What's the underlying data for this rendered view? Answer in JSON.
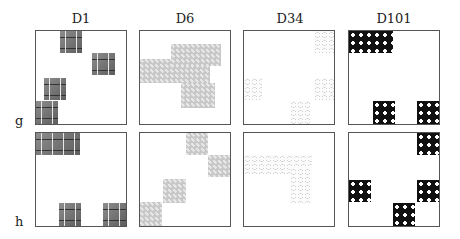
{
  "figure": {
    "column_titles": [
      "D1",
      "D6",
      "D34",
      "D101"
    ],
    "row_labels": [
      "g",
      "h"
    ]
  },
  "panels": {
    "g": {
      "D1": {
        "texture": "brick-stone",
        "patches": [
          [
            0.27,
            0.0,
            0.24,
            0.24
          ],
          [
            0.62,
            0.24,
            0.25,
            0.24
          ],
          [
            0.09,
            0.51,
            0.24,
            0.24
          ],
          [
            0.0,
            0.75,
            0.24,
            0.25
          ]
        ]
      },
      "D6": {
        "texture": "honeycomb-gray",
        "patches": [
          [
            0.0,
            0.3,
            0.78,
            0.26
          ],
          [
            0.35,
            0.14,
            0.55,
            0.24
          ],
          [
            0.46,
            0.56,
            0.38,
            0.27
          ]
        ]
      },
      "D34": {
        "texture": "mesh-pale",
        "patches": [
          [
            0.78,
            0.0,
            0.22,
            0.24
          ],
          [
            0.0,
            0.51,
            0.2,
            0.24
          ],
          [
            0.78,
            0.51,
            0.22,
            0.24
          ],
          [
            0.51,
            0.75,
            0.22,
            0.25
          ]
        ]
      },
      "D101": {
        "texture": "black-circles",
        "patches": [
          [
            0.0,
            0.0,
            0.49,
            0.24
          ],
          [
            0.27,
            0.75,
            0.24,
            0.25
          ],
          [
            0.76,
            0.75,
            0.24,
            0.25
          ]
        ]
      }
    },
    "h": {
      "D1": {
        "texture": "brick-stone",
        "patches": [
          [
            0.0,
            0.0,
            0.49,
            0.24
          ],
          [
            0.25,
            0.75,
            0.24,
            0.25
          ],
          [
            0.74,
            0.75,
            0.26,
            0.25
          ]
        ]
      },
      "D6": {
        "texture": "honeycomb-gray",
        "patches": [
          [
            0.51,
            0.0,
            0.24,
            0.24
          ],
          [
            0.75,
            0.24,
            0.25,
            0.24
          ],
          [
            0.25,
            0.49,
            0.25,
            0.26
          ],
          [
            0.0,
            0.74,
            0.24,
            0.26
          ]
        ]
      },
      "D34": {
        "texture": "mesh-pale",
        "patches": [
          [
            0.0,
            0.24,
            0.75,
            0.2
          ],
          [
            0.51,
            0.38,
            0.24,
            0.38
          ]
        ]
      },
      "D101": {
        "texture": "black-circles",
        "patches": [
          [
            0.76,
            0.0,
            0.24,
            0.24
          ],
          [
            0.0,
            0.51,
            0.24,
            0.24
          ],
          [
            0.76,
            0.51,
            0.24,
            0.24
          ],
          [
            0.49,
            0.75,
            0.24,
            0.25
          ]
        ]
      }
    }
  },
  "colors": {
    "border": "#555555",
    "text": "#222222",
    "D1": "#7a7a7a",
    "D6": "#c8c8c8",
    "D34": "#c4c4c4",
    "D101": "#111111"
  }
}
